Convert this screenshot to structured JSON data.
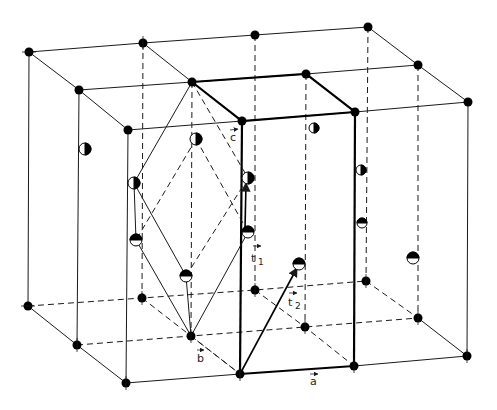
{
  "figure": {
    "colors": {
      "line": "#1a1a1a",
      "atom_fill": "#000000",
      "atom_half_white": "#ffffff",
      "background": "#ffffff"
    }
  },
  "labels": {
    "c": "c",
    "b": "b",
    "a": "a",
    "t1": "t",
    "t1_sub": "1",
    "t2": "t",
    "t2_sub": "2"
  },
  "lattice_nodes": {
    "top": [
      [
        29,
        52
      ],
      [
        143,
        43
      ],
      [
        255,
        35
      ],
      [
        368,
        27
      ],
      [
        79,
        90
      ],
      [
        192,
        82
      ],
      [
        306,
        74
      ],
      [
        418,
        65
      ],
      [
        128,
        130
      ],
      [
        242,
        121
      ],
      [
        355,
        112
      ],
      [
        468,
        102
      ]
    ],
    "bottom": [
      [
        28,
        306
      ],
      [
        142,
        298
      ],
      [
        255,
        290
      ],
      [
        366,
        281
      ],
      [
        77,
        345
      ],
      [
        191,
        336
      ],
      [
        305,
        327
      ],
      [
        418,
        318
      ],
      [
        126,
        383
      ],
      [
        240,
        374
      ],
      [
        354,
        366
      ],
      [
        467,
        356
      ]
    ]
  },
  "half_atoms": [
    {
      "x": 85,
      "y": 149,
      "type": "left-white"
    },
    {
      "x": 196,
      "y": 139,
      "type": "left-white"
    },
    {
      "x": 134,
      "y": 183,
      "type": "left-white"
    },
    {
      "x": 248,
      "y": 178,
      "type": "left-white"
    },
    {
      "x": 314,
      "y": 128,
      "type": "left-white"
    },
    {
      "x": 361,
      "y": 170,
      "type": "left-white"
    },
    {
      "x": 136,
      "y": 240,
      "type": "top-black"
    },
    {
      "x": 186,
      "y": 276,
      "type": "top-black"
    },
    {
      "x": 248,
      "y": 232,
      "type": "top-black"
    },
    {
      "x": 299,
      "y": 264,
      "type": "top-black"
    },
    {
      "x": 362,
      "y": 223,
      "type": "top-black"
    },
    {
      "x": 413,
      "y": 258,
      "type": "top-black"
    }
  ]
}
